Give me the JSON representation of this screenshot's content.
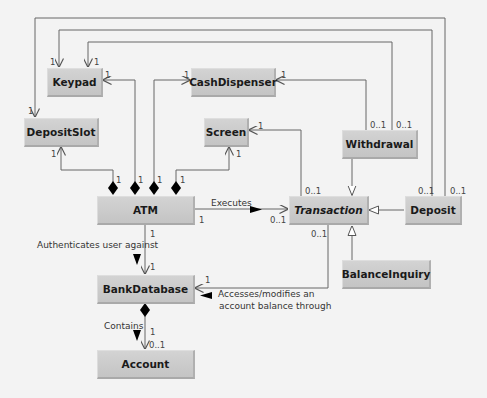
{
  "diagram": {
    "type": "UML class diagram",
    "classes": [
      {
        "id": "keypad",
        "name": "Keypad",
        "abstract": false
      },
      {
        "id": "cashdispenser",
        "name": "CashDispenser",
        "abstract": false
      },
      {
        "id": "depositslot",
        "name": "DepositSlot",
        "abstract": false
      },
      {
        "id": "screen",
        "name": "Screen",
        "abstract": false
      },
      {
        "id": "withdrawal",
        "name": "Withdrawal",
        "abstract": false
      },
      {
        "id": "atm",
        "name": "ATM",
        "abstract": false
      },
      {
        "id": "transaction",
        "name": "Transaction",
        "abstract": true
      },
      {
        "id": "deposit",
        "name": "Deposit",
        "abstract": false
      },
      {
        "id": "balanceinquiry",
        "name": "BalanceInquiry",
        "abstract": false
      },
      {
        "id": "bankdatabase",
        "name": "BankDatabase",
        "abstract": false
      },
      {
        "id": "account",
        "name": "Account",
        "abstract": false
      }
    ],
    "relationships": [
      {
        "from": "ATM",
        "to": "DepositSlot",
        "kind": "composition",
        "mult_from": "1",
        "mult_to": "1"
      },
      {
        "from": "ATM",
        "to": "Keypad",
        "kind": "composition",
        "mult_from": "1",
        "mult_to": "1"
      },
      {
        "from": "ATM",
        "to": "CashDispenser",
        "kind": "composition",
        "mult_from": "1",
        "mult_to": "1"
      },
      {
        "from": "ATM",
        "to": "Screen",
        "kind": "composition",
        "mult_from": "1",
        "mult_to": "1"
      },
      {
        "from": "ATM",
        "to": "Transaction",
        "kind": "association",
        "label": "Executes",
        "mult_from": "1",
        "mult_to": "0..1"
      },
      {
        "from": "ATM",
        "to": "BankDatabase",
        "kind": "association",
        "label": "Authenticates user against",
        "mult_from": "1",
        "mult_to": "1"
      },
      {
        "from": "BankDatabase",
        "to": "Account",
        "kind": "composition",
        "label": "Contains",
        "mult_from": "1",
        "mult_to": "0..1"
      },
      {
        "from": "Transaction",
        "to": "BankDatabase",
        "kind": "association",
        "label": "Accesses/modifies an account balance through",
        "mult_from": "0..1",
        "mult_to": "1"
      },
      {
        "from": "Transaction",
        "to": "Screen",
        "kind": "association",
        "mult_from": "0..1",
        "mult_to": "1"
      },
      {
        "from": "Withdrawal",
        "to": "Transaction",
        "kind": "generalization"
      },
      {
        "from": "Deposit",
        "to": "Transaction",
        "kind": "generalization"
      },
      {
        "from": "BalanceInquiry",
        "to": "Transaction",
        "kind": "generalization"
      },
      {
        "from": "Withdrawal",
        "to": "CashDispenser",
        "kind": "association",
        "mult_from": "0..1",
        "mult_to": "1"
      },
      {
        "from": "Withdrawal",
        "to": "Keypad",
        "kind": "association",
        "mult_from": "0..1",
        "mult_to": "1"
      },
      {
        "from": "Deposit",
        "to": "Keypad",
        "kind": "association",
        "mult_from": "0..1",
        "mult_to": "1"
      },
      {
        "from": "Deposit",
        "to": "DepositSlot",
        "kind": "association",
        "mult_from": "0..1",
        "mult_to": "1"
      }
    ],
    "labels": {
      "executes": "Executes",
      "authenticates": "Authenticates user against",
      "contains": "Contains",
      "accesses_line1": "Accesses/modifies an",
      "accesses_line2": "account balance through"
    },
    "multiplicities": {
      "one": "1",
      "zero_one": "0..1"
    },
    "colors": {
      "background": "#f3f3f3",
      "box_fill": "#cccccc",
      "line": "#555555",
      "text": "#1a1a1a"
    }
  }
}
